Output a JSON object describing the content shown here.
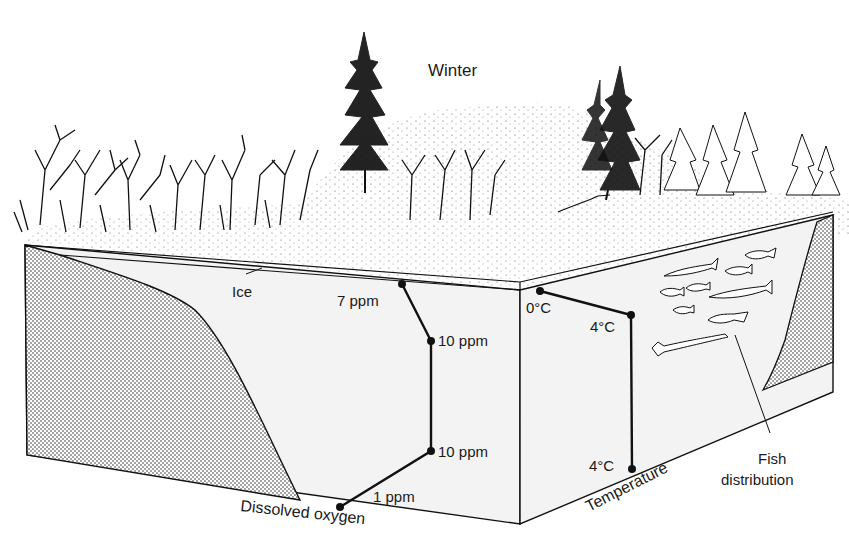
{
  "title": "Winter",
  "labels": {
    "ice": "Ice",
    "dissolved_oxygen": "Dissolved oxygen",
    "temperature": "Temperature",
    "fish_line1": "Fish",
    "fish_line2": "distribution"
  },
  "oxygen_profile": [
    {
      "label": "7 ppm"
    },
    {
      "label": "10 ppm"
    },
    {
      "label": "10 ppm"
    },
    {
      "label": "1 ppm"
    }
  ],
  "temperature_profile": [
    {
      "label": "0°C"
    },
    {
      "label": "4°C"
    },
    {
      "label": "4°C"
    }
  ],
  "colors": {
    "ink": "#111111",
    "water": "#f3f3f3",
    "sediment": "#d8d8d8"
  }
}
